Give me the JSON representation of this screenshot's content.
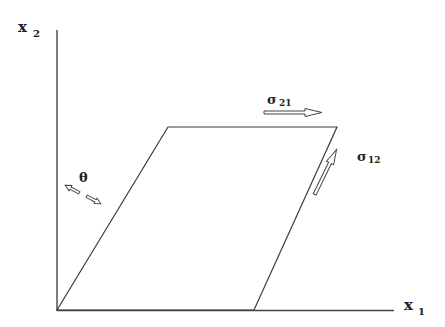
{
  "diagram": {
    "axes": {
      "x": {
        "label": "x",
        "subscript": "1"
      },
      "y": {
        "label": "x",
        "subscript": "2"
      }
    },
    "stresses": [
      {
        "id": "sigma21",
        "symbol": "σ",
        "subscript": "21",
        "direction": "horizontal-right"
      },
      {
        "id": "sigma12",
        "symbol": "σ",
        "subscript": "12",
        "direction": "along-slanted-edge-up"
      }
    ],
    "angle": {
      "symbol": "θ"
    },
    "shape": "parallelogram (sheared square)",
    "colors": {
      "line": "#3a3a3a"
    }
  }
}
